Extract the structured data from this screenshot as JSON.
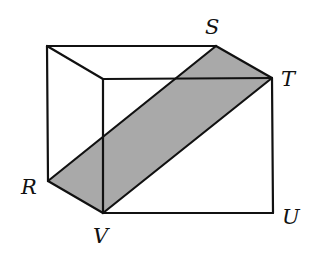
{
  "diagram": {
    "type": "rectangular-prism-with-shaded-cross-section",
    "colors": {
      "edge": "#111111",
      "shade": "#a9a9a9",
      "background": "#ffffff"
    },
    "vertices": {
      "back_top_left": [
        47,
        46
      ],
      "S": [
        216,
        46
      ],
      "front_top_left": [
        103,
        79
      ],
      "T": [
        272,
        78
      ],
      "R": [
        48,
        181
      ],
      "V": [
        103,
        213
      ],
      "U": [
        273,
        213
      ]
    },
    "labels": [
      {
        "id": "S",
        "text": "S",
        "x": 205,
        "y": 34
      },
      {
        "id": "T",
        "text": "T",
        "x": 281,
        "y": 86
      },
      {
        "id": "R",
        "text": "R",
        "x": 21,
        "y": 194
      },
      {
        "id": "V",
        "text": "V",
        "x": 93,
        "y": 243
      },
      {
        "id": "U",
        "text": "U",
        "x": 282,
        "y": 224
      }
    ],
    "shaded_region": "R-S-T-V"
  }
}
